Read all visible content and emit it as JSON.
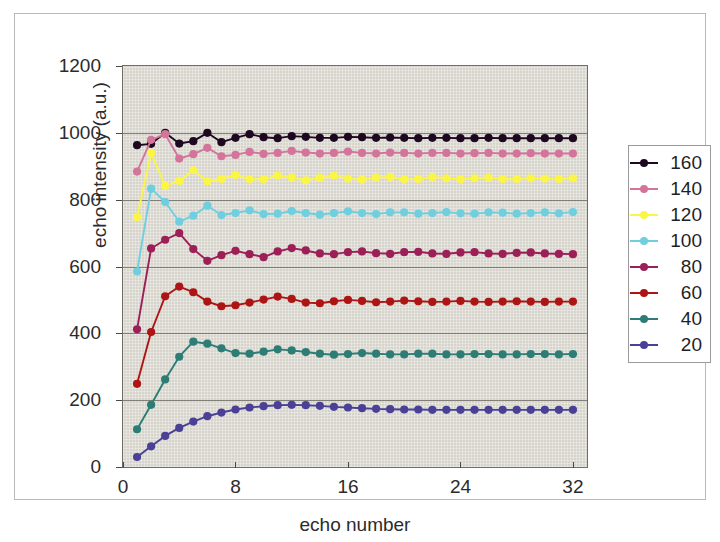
{
  "figure": {
    "background_color": "#ffffff",
    "frame_color": "#b9b9b9",
    "plot_background_color": "#d7d4cc",
    "gridline_color": "#6e6e66"
  },
  "axes": {
    "y_title": "echo intensity (a.u.)",
    "x_title": "echo number",
    "y_ticks": [
      "0",
      "200",
      "400",
      "600",
      "800",
      "1000",
      "1200"
    ],
    "x_ticks": [
      "0",
      "8",
      "16",
      "24",
      "32"
    ]
  },
  "legend": {
    "position": "right",
    "entries": [
      {
        "label": "160",
        "color": "#1d0820"
      },
      {
        "label": "140",
        "color": "#d4749b"
      },
      {
        "label": "120",
        "color": "#fbf545"
      },
      {
        "label": "100",
        "color": "#6fcfdf"
      },
      {
        "label": "80",
        "color": "#9c1f57"
      },
      {
        "label": "60",
        "color": "#ad1414"
      },
      {
        "label": "40",
        "color": "#2d7d76"
      },
      {
        "label": "20",
        "color": "#4a4196"
      }
    ]
  },
  "chart_data": {
    "type": "line",
    "title": "",
    "xlabel": "echo number",
    "ylabel": "echo intensity (a.u.)",
    "xlim": [
      0,
      33
    ],
    "ylim": [
      0,
      1200
    ],
    "xticks": [
      0,
      8,
      16,
      24,
      32
    ],
    "yticks": [
      0,
      200,
      400,
      600,
      800,
      1000,
      1200
    ],
    "grid": true,
    "legend_position": "right",
    "x": [
      1,
      2,
      3,
      4,
      5,
      6,
      7,
      8,
      9,
      10,
      11,
      12,
      13,
      14,
      15,
      16,
      17,
      18,
      19,
      20,
      21,
      22,
      23,
      24,
      25,
      26,
      27,
      28,
      29,
      30,
      31,
      32
    ],
    "series": [
      {
        "name": "160",
        "color": "#1d0820",
        "values": [
          963,
          967,
          1000,
          968,
          975,
          1000,
          972,
          985,
          996,
          987,
          984,
          990,
          988,
          985,
          985,
          988,
          987,
          985,
          986,
          985,
          984,
          985,
          985,
          984,
          984,
          985,
          984,
          984,
          984,
          984,
          984,
          984
        ]
      },
      {
        "name": "140",
        "color": "#d4749b",
        "values": [
          884,
          979,
          996,
          923,
          936,
          955,
          930,
          934,
          943,
          937,
          940,
          946,
          941,
          938,
          940,
          944,
          940,
          938,
          941,
          940,
          938,
          940,
          940,
          938,
          939,
          940,
          938,
          938,
          939,
          938,
          938,
          938
        ]
      },
      {
        "name": "120",
        "color": "#fbf545",
        "values": [
          748,
          940,
          841,
          856,
          888,
          855,
          862,
          874,
          861,
          861,
          872,
          866,
          858,
          865,
          872,
          863,
          860,
          866,
          868,
          861,
          862,
          868,
          864,
          861,
          864,
          866,
          862,
          862,
          864,
          863,
          862,
          864
        ]
      },
      {
        "name": "100",
        "color": "#6fcfdf",
        "values": [
          585,
          833,
          793,
          734,
          752,
          782,
          754,
          760,
          768,
          757,
          758,
          766,
          760,
          755,
          760,
          765,
          760,
          757,
          762,
          762,
          758,
          760,
          763,
          759,
          758,
          762,
          761,
          758,
          760,
          762,
          759,
          763
        ]
      },
      {
        "name": "80",
        "color": "#9c1f57",
        "values": [
          412,
          654,
          680,
          700,
          652,
          617,
          634,
          647,
          637,
          628,
          645,
          655,
          648,
          639,
          637,
          643,
          645,
          640,
          638,
          643,
          644,
          639,
          638,
          642,
          643,
          639,
          638,
          641,
          642,
          639,
          638,
          637
        ]
      },
      {
        "name": "60",
        "color": "#ad1414",
        "values": [
          249,
          404,
          511,
          540,
          523,
          495,
          481,
          484,
          492,
          501,
          510,
          503,
          492,
          490,
          496,
          500,
          497,
          493,
          495,
          498,
          496,
          494,
          495,
          497,
          495,
          494,
          495,
          496,
          495,
          494,
          495,
          495
        ]
      },
      {
        "name": "40",
        "color": "#2d7d76",
        "values": [
          113,
          186,
          262,
          330,
          375,
          369,
          355,
          341,
          339,
          345,
          352,
          349,
          344,
          339,
          336,
          338,
          341,
          339,
          337,
          337,
          339,
          339,
          337,
          337,
          338,
          338,
          337,
          337,
          338,
          338,
          337,
          338
        ]
      },
      {
        "name": "20",
        "color": "#4a4196",
        "values": [
          30,
          62,
          93,
          117,
          136,
          152,
          163,
          172,
          178,
          182,
          185,
          186,
          185,
          183,
          180,
          178,
          176,
          174,
          173,
          172,
          172,
          171,
          171,
          171,
          171,
          171,
          171,
          171,
          171,
          171,
          171,
          171
        ]
      }
    ]
  }
}
